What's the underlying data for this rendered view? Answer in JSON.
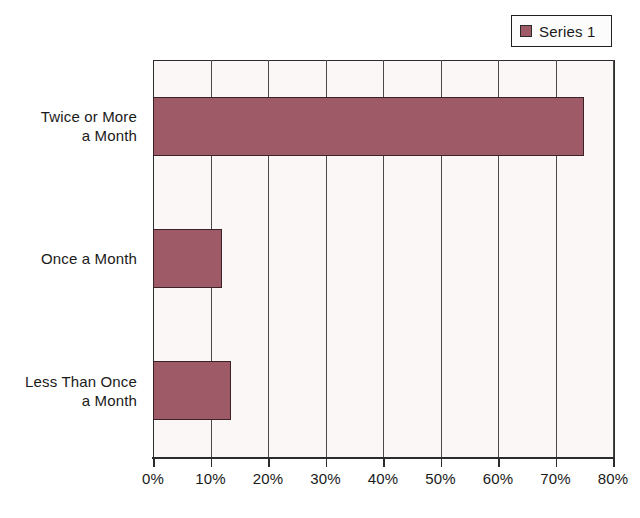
{
  "chart_data": {
    "type": "bar",
    "orientation": "horizontal",
    "title": "",
    "subtitle": "",
    "xlabel": "",
    "ylabel": "",
    "categories": [
      "Twice or More a Month",
      "Once a Month",
      "Less Than Once a Month"
    ],
    "category_lines": [
      [
        "Twice or More",
        "a Month"
      ],
      [
        "Once a Month"
      ],
      [
        "Less Than Once",
        "a Month"
      ]
    ],
    "series": [
      {
        "name": "Series 1",
        "values": [
          75,
          12,
          13.5
        ],
        "color": "#9e5a66"
      }
    ],
    "xlim": [
      0,
      80
    ],
    "xticks": [
      0,
      10,
      20,
      30,
      40,
      50,
      60,
      70,
      80
    ],
    "xtick_labels": [
      "0%",
      "10%",
      "20%",
      "30%",
      "40%",
      "50%",
      "60%",
      "70%",
      "80%"
    ],
    "grid": "vertical",
    "legend_position": "top-right",
    "legend_entries": [
      "Series 1"
    ],
    "plot_background": "#faf7f6",
    "axis_color": "#2b2b2b",
    "bar_border_color": "#3a2226"
  },
  "legend": {
    "series_1_label": "Series 1"
  }
}
